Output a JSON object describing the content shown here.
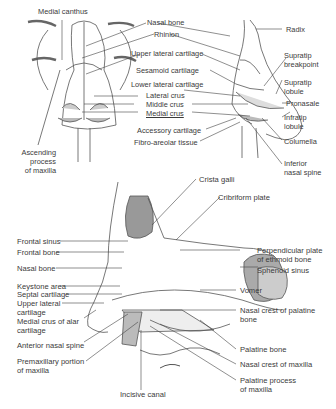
{
  "figures": {
    "frontal_view": {
      "labels": {
        "medial_canthus": "Medial canthus",
        "ascending_process_1": "Ascending",
        "ascending_process_2": "process",
        "ascending_process_3": "of maxilla"
      }
    },
    "shared_center_labels": {
      "nasal_bone": "Nasal bone",
      "rhinion": "Rhinion",
      "upper_lateral_cartilage": "Upper lateral cartilage",
      "sesamoid_cartilage": "Sesamoid cartilage",
      "lower_lateral_cartilage": "Lower lateral cartilage",
      "lateral_crus": "Lateral crus",
      "middle_crus": "Middle crus",
      "medial_crus": "Medial crus",
      "accessory_cartilage": "Accessory cartilage",
      "fibro_areolar_tissue": "Fibro-areolar tissue"
    },
    "lateral_view": {
      "labels": {
        "radix": "Radix",
        "supratip_breakpoint_1": "Supratip",
        "supratip_breakpoint_2": "breakpoint",
        "supratip_lobule_1": "Supratip",
        "supratip_lobule_2": "lobule",
        "pronasale": "Pronasale",
        "infratip_lobule_1": "Infratip",
        "infratip_lobule_2": "lobule",
        "columella": "Columella",
        "inferior_nasal_spine_1": "Inferior",
        "inferior_nasal_spine_2": "nasal spine"
      }
    },
    "sagittal_section": {
      "left_labels": {
        "frontal_sinus": "Frontal sinus",
        "frontal_bone": "Frontal bone",
        "nasal_bone": "Nasal bone",
        "keystone_area": "Keystone area",
        "septal_cartilage": "Septal cartilage",
        "upper_lateral_cartilage_1": "Upper lateral",
        "upper_lateral_cartilage_2": "cartilage",
        "medial_crus_alar_1": "Medial crus of alar",
        "medial_crus_alar_2": "cartilage",
        "anterior_nasal_spine": "Anterior nasal spine",
        "premaxillary_1": "Premaxillary portion",
        "premaxillary_2": "of maxilla"
      },
      "right_labels": {
        "crista_galli": "Crista galli",
        "cribriform_plate": "Cribriform plate",
        "perpendicular_plate_1": "Perpendicular plate",
        "perpendicular_plate_2": "of ethmoid bone",
        "sphenoid_sinus": "Sphenoid sinus",
        "vomer": "Vomer",
        "nasal_crest_palatine_1": "Nasal crest of palatine",
        "nasal_crest_palatine_2": "bone",
        "palatine_bone": "Palatine bone",
        "nasal_crest_maxilla": "Nasal crest of maxilla",
        "palatine_process_1": "Palatine process",
        "palatine_process_2": "of maxilla"
      },
      "bottom_labels": {
        "incisive_canal": "Incisive canal"
      }
    }
  }
}
